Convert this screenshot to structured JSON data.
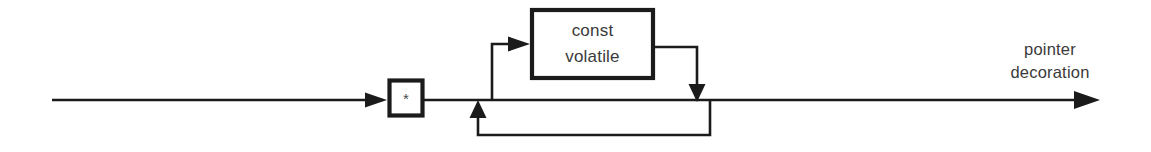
{
  "diagram": {
    "kind": "railroad-syntax-diagram",
    "title": "pointer decoration",
    "background_color": "#ffffff",
    "line_color": "#1b1b1b",
    "text_color": "#3a3a3a",
    "nodes": {
      "asterisk": {
        "label": "*",
        "name": "asterisk-terminal"
      },
      "qualifier": {
        "line1": "const",
        "line2": "volatile",
        "name": "qualifier-box"
      }
    },
    "caption": {
      "line1": "pointer",
      "line2": "decoration"
    }
  }
}
